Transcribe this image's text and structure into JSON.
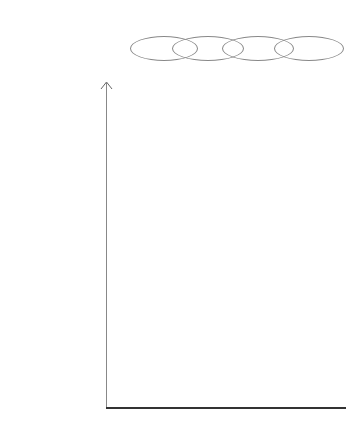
{
  "states": [
    {
      "jp_top": "粗大",
      "en_top": "Gross",
      "en_bottom": "Nature",
      "jp_bottom": "自然神秘主義",
      "x": 156
    },
    {
      "jp_top": "微細",
      "en_top": "Subtle",
      "en_bottom": "Deity",
      "jp_bottom": "神性神秘主義",
      "x": 206
    },
    {
      "jp_top": "元因",
      "en_top": "Causal",
      "en_bottom": "Formless",
      "jp_bottom": "無形神秘主義",
      "x": 256
    },
    {
      "jp_top": "非二元",
      "en_top": "Nondual",
      "en_bottom": "Nondual",
      "jp_bottom": "非二元神秘主義",
      "x": 307
    }
  ],
  "structures": [
    {
      "en": "SUPER-INTEGRAL",
      "jp": "超 - 統合的",
      "y": 121,
      "intensity": 0.9
    },
    {
      "en": "INTEGRAL",
      "jp": "統合的",
      "y": 161,
      "intensity": 0.75
    },
    {
      "en": "PLURALISTIC",
      "jp": "多元主義的",
      "y": 201,
      "intensity": 0.55
    },
    {
      "en": "RATIONAL",
      "jp": "合理的",
      "y": 242,
      "intensity": 0.3
    },
    {
      "en": "MYTHIC",
      "jp": "神話的",
      "y": 283,
      "intensity": 0.75
    },
    {
      "en": "MAGIC",
      "jp": "呪術的",
      "y": 324,
      "intensity": 0.8
    },
    {
      "en": "ARCHAIC",
      "jp": "古代的",
      "y": 365,
      "intensity": 0.6
    }
  ],
  "icons": {
    "y_axis_arrow": "arrow-up-icon"
  },
  "colors": {
    "blob": "#222222",
    "grid": "#555555",
    "axis": "#333333"
  }
}
